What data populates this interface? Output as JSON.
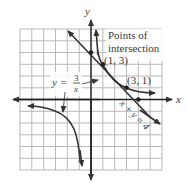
{
  "diagram": {
    "type": "coordinate-graph",
    "axes": {
      "x_label": "x",
      "y_label": "y",
      "x_range": [
        -6,
        6
      ],
      "y_range": [
        -6,
        6
      ],
      "grid": true
    },
    "annotation": {
      "title_line1": "Points of",
      "title_line2": "intersection",
      "point1_label": "(1, 3)",
      "point2_label": "(3, 1)"
    },
    "hyperbola_label": {
      "lhs": "y =",
      "numerator": "3",
      "denominator": "x"
    },
    "line_label": "x + y = 4",
    "points": [
      {
        "x": 0,
        "y": 4
      },
      {
        "x": 1,
        "y": 3
      },
      {
        "x": 3,
        "y": 1
      },
      {
        "x": 4,
        "y": 0
      }
    ],
    "colors": {
      "grid": "#b8b8b8",
      "curve": "#333333",
      "axis": "#222222"
    }
  }
}
